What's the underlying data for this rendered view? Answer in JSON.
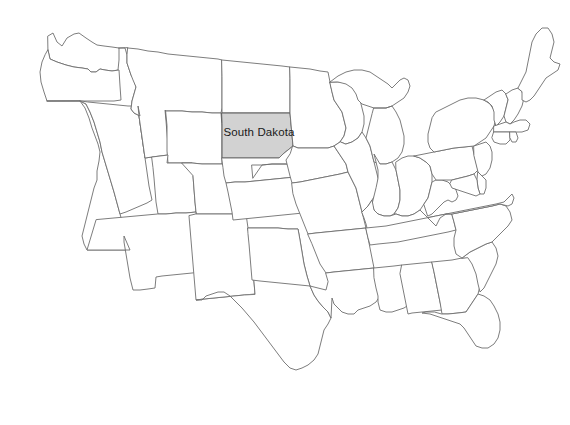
{
  "map": {
    "title": "United States contiguous states outline map",
    "background_color": "#ffffff",
    "default_state_fill": "#ffffff",
    "state_border_color": "#6e6e6e",
    "highlight_fill": "#d2d2d2",
    "highlight_border_color": "#5a5a5a",
    "label_color": "#1a1a1a",
    "highlighted_state": "South Dakota",
    "labels": [
      {
        "name": "south-dakota",
        "text": "South Dakota",
        "x": 259,
        "y": 133
      }
    ],
    "states": [
      {
        "id": "washington",
        "name": "Washington",
        "highlighted": false,
        "path": "M48,36 L53,33 L57,42 L62,46 L67,38 L74,34 L79,33 L86,38 L92,42 L97,45 L104,46 L112,47 L119,48 L119,60 L118,70 L112,71 L105,70 L100,69 L96,72 L91,72 L88,69 L82,68 L74,67 L66,65 L57,62 L50,59 L48,50 Z"
      },
      {
        "id": "oregon",
        "name": "Oregon",
        "highlighted": false,
        "path": "M48,50 L50,59 L57,62 L66,65 L74,67 L82,68 L88,69 L91,72 L96,72 L100,69 L105,70 L112,71 L119,70 L120,86 L121,100 L114,101 L104,101 L92,101 L80,101 L70,101 L61,101 L53,101 L47,101 L44,92 L41,82 L40,72 L42,62 L45,55 Z"
      },
      {
        "id": "california",
        "name": "California",
        "highlighted": false,
        "path": "M47,101 L53,101 L61,101 L70,101 L80,101 L85,108 L89,118 L92,128 L95,136 L98,144 L100,152 L99,161 L97,171 L97,180 L94,188 L92,196 L90,204 L88,212 L86,220 L84,228 L82,236 L84,244 L87,250 L92,250 L100,250 L108,250 L116,250 L124,250 L130,250 L128,242 L126,234 L123,225 L120,214 L117,203 L114,192 L111,182 L108,172 L105,162 L102,152 L100,142 L97,132 L94,122 L90,112 L86,104 L80,101 Z"
      },
      {
        "id": "nevada",
        "name": "Nevada",
        "highlighted": false,
        "path": "M80,101 L86,104 L90,112 L94,122 L97,132 L100,142 L102,152 L105,162 L108,172 L111,182 L114,192 L117,203 L120,214 L126,212 L133,209 L140,206 L147,203 L152,200 L149,186 L147,172 L145,158 L143,144 L141,130 L139,116 L138,106 L128,106 L118,105 L108,104 L98,103 L88,102 Z"
      },
      {
        "id": "idaho",
        "name": "Idaho",
        "highlighted": false,
        "path": "M119,48 L125,48 L127,55 L127,63 L129,69 L131,75 L134,80 L136,87 L134,94 L132,101 L131,109 L134,113 L140,116 L138,106 L139,116 L141,130 L143,144 L145,158 L152,157 L160,156 L168,155 L168,145 L167,133 L166,121 L165,110 L160,110 L155,110 L150,106 L145,101 L140,96 L137,88 L135,80 L133,72 L131,64 L130,56 L128,48 Z"
      },
      {
        "id": "montana",
        "name": "Montana",
        "highlighted": false,
        "path": "M128,48 L138,49 L148,51 L158,52 L168,54 L178,55 L188,56 L198,57 L208,58 L218,59 L222,60 L222,72 L222,84 L222,96 L222,108 L221,113 L212,113 L202,112 L192,112 L182,111 L172,111 L166,111 L165,110 L166,121 L167,133 L168,145 L168,155 L160,156 L152,157 L145,158 L143,144 L141,130 L139,116 L138,106 L140,116 L134,113 L131,109 L132,101 L134,94 L136,87 L133,80 L131,75 L129,69 L127,63 L127,55 Z"
      },
      {
        "id": "wyoming",
        "name": "Wyoming",
        "highlighted": false,
        "path": "M166,111 L172,111 L182,111 L192,112 L202,112 L212,113 L221,113 L222,126 L222,139 L222,152 L222,164 L212,164 L202,164 L192,163 L182,163 L173,163 L168,163 L167,151 L167,139 L167,126 Z"
      },
      {
        "id": "utah",
        "name": "Utah",
        "highlighted": false,
        "path": "M152,157 L160,156 L168,155 L167,163 L168,163 L173,163 L182,163 L192,163 L193,176 L194,189 L195,202 L196,212 L186,213 L176,213 L166,214 L158,214 L156,202 L155,190 L154,178 L153,168 Z"
      },
      {
        "id": "colorado",
        "name": "Colorado",
        "highlighted": false,
        "path": "M182,163 L192,163 L202,164 L212,164 L222,164 L232,164 L242,164 L252,165 L253,178 L254,191 L255,204 L256,214 L246,214 L236,214 L226,214 L216,214 L206,214 L196,214 L196,212 L195,202 L194,189 L193,176 Z"
      },
      {
        "id": "arizona",
        "name": "Arizona",
        "highlighted": false,
        "path": "M158,214 L166,214 L176,213 L186,213 L196,212 L196,214 L197,226 L198,238 L199,250 L200,262 L201,272 L192,273 L182,274 L172,275 L162,276 L156,277 L155,288 L148,289 L140,290 L133,290 L130,278 L128,266 L126,254 L124,242 L124,236 L130,250 L124,250 L116,250 L108,250 L100,250 L92,250 L87,250 L90,240 L93,230 L96,220 Z"
      },
      {
        "id": "new-mexico",
        "name": "New Mexico",
        "highlighted": false,
        "path": "M196,214 L206,214 L216,214 L226,214 L236,214 L246,214 L248,228 L250,242 L251,256 L253,270 L254,282 L255,294 L244,295 L234,296 L224,297 L214,298 L204,299 L196,300 L195,288 L194,276 L193,264 L192,252 L191,240 L190,228 L189,216 Z"
      },
      {
        "id": "texas",
        "name": "Texas",
        "highlighted": false,
        "path": "M255,294 L254,282 L253,270 L251,256 L250,242 L248,228 L258,228 L268,228 L278,228 L288,229 L298,229 L300,240 L302,252 L304,264 L307,276 L310,286 L314,295 L318,301 L323,307 L328,312 L331,318 L328,324 L324,330 L322,338 L320,346 L318,354 L314,360 L308,365 L302,368 L296,370 L290,368 L284,362 L278,354 L272,346 L266,338 L260,330 L254,322 L248,315 L242,308 L236,302 L230,296 L224,292 L218,292 L212,294 L206,296 L202,300 L196,300 L204,299 L214,298 L224,297 L234,296 L244,295 Z"
      },
      {
        "id": "north-dakota",
        "name": "North Dakota",
        "highlighted": false,
        "path": "M222,60 L232,61 L242,62 L252,63 L262,64 L272,65 L282,66 L290,67 L290,79 L290,91 L290,103 L290,113 L280,113 L270,113 L260,113 L250,113 L240,113 L230,113 L222,113 L222,101 L222,89 L222,77 Z"
      },
      {
        "id": "south-dakota",
        "name": "South Dakota",
        "highlighted": true,
        "path": "M222,113 L230,113 L240,113 L250,113 L260,113 L270,113 L280,113 L290,113 L291,124 L292,135 L293,146 L288,150 L283,154 L279,158 L272,158 L262,158 L252,158 L242,158 L232,158 L222,158 L222,147 L222,136 L222,124 Z"
      },
      {
        "id": "nebraska",
        "name": "Nebraska",
        "highlighted": false,
        "path": "M222,158 L232,158 L242,158 L252,158 L262,158 L272,158 L279,158 L283,154 L288,150 L293,146 L296,152 L300,158 L304,164 L308,170 L312,175 L305,176 L295,177 L285,178 L275,179 L265,180 L255,181 L245,182 L235,182 L226,183 L224,176 L223,168 Z"
      },
      {
        "id": "kansas",
        "name": "Kansas",
        "highlighted": false,
        "path": "M252,165 L262,165 L272,164 L282,164 L292,164 L300,164 L308,170 L312,175 L305,176 L295,177 L285,178 L275,179 L265,180 L255,181 L245,182 L235,182 L226,183 L228,192 L230,202 L232,212 L233,220 L243,219 L253,218 L263,217 L273,216 L283,215 L293,214 L303,213 L313,212 L318,212 L316,202 L314,192 L312,182 L310,175 L305,176 L312,175 L308,170 L300,164 L292,164 L282,164 L272,164 L262,165 L253,178 Z"
      },
      {
        "id": "oklahoma",
        "name": "Oklahoma",
        "highlighted": false,
        "path": "M248,228 L258,228 L268,228 L278,228 L288,229 L298,229 L300,240 L302,252 L304,264 L307,276 L310,286 L300,285 L290,284 L280,283 L270,282 L260,281 L252,280 L251,268 L250,256 L249,244 L248,234 Z"
      },
      {
        "id": "minnesota",
        "name": "Minnesota",
        "highlighted": false,
        "path": "M290,67 L300,68 L310,69 L320,71 L328,72 L330,82 L332,92 L334,100 L338,106 L342,112 L344,120 L346,128 L344,136 L340,142 L334,146 L328,148 L322,148 L316,148 L310,148 L304,148 L298,148 L293,146 L292,135 L291,124 L290,113 L290,103 L290,91 L290,79 Z"
      },
      {
        "id": "iowa",
        "name": "Iowa",
        "highlighted": false,
        "path": "M293,146 L298,148 L304,148 L310,148 L316,148 L322,148 L328,148 L334,146 L338,152 L342,158 L346,164 L348,172 L340,174 L330,176 L320,178 L310,180 L300,182 L292,183 L290,176 L288,168 L286,160 L290,154 Z"
      },
      {
        "id": "missouri",
        "name": "Missouri",
        "highlighted": false,
        "path": "M292,183 L300,182 L310,180 L320,178 L330,176 L340,174 L348,172 L352,180 L356,188 L358,196 L360,204 L362,212 L364,220 L366,228 L356,229 L346,230 L336,231 L326,232 L316,233 L308,234 L304,224 L300,214 L296,204 L293,194 Z"
      },
      {
        "id": "arkansas",
        "name": "Arkansas",
        "highlighted": false,
        "path": "M308,234 L316,233 L326,232 L336,231 L346,230 L356,229 L366,228 L368,238 L370,248 L372,258 L374,268 L364,269 L354,270 L344,271 L334,272 L326,273 L320,264 L316,254 L312,244 Z"
      },
      {
        "id": "louisiana",
        "name": "Louisiana",
        "highlighted": false,
        "path": "M326,273 L334,272 L344,271 L354,270 L364,269 L374,268 L376,278 L378,288 L380,296 L376,302 L370,306 L364,308 L358,310 L354,314 L348,314 L342,312 L338,308 L334,304 L332,298 L331,318 L328,312 L323,307 L318,301 L314,295 L310,286 L318,288 L326,290 L328,282 Z"
      },
      {
        "id": "wisconsin",
        "name": "Wisconsin",
        "highlighted": false,
        "path": "M330,82 L338,82 L346,82 L352,84 L356,88 L358,94 L360,100 L362,108 L364,116 L364,124 L362,132 L358,138 L352,142 L346,144 L340,142 L344,136 L346,128 L344,120 L342,112 L338,106 L334,100 L332,92 Z"
      },
      {
        "id": "illinois",
        "name": "Illinois",
        "highlighted": false,
        "path": "M346,144 L352,142 L358,138 L362,132 L366,138 L370,146 L372,154 L374,162 L376,170 L378,178 L378,186 L376,194 L372,200 L368,206 L364,210 L362,212 L360,204 L358,196 L356,188 L352,180 L348,172 L346,164 L342,158 L338,152 L334,146 L340,142 Z"
      },
      {
        "id": "michigan",
        "name": "Michigan",
        "highlighted": false,
        "path": "M330,82 L338,76 L346,72 L354,70 L362,70 L370,72 L376,76 L382,80 L388,84 L392,88 L396,84 L400,80 L404,78 L408,80 L410,86 L408,92 L404,98 L398,102 L392,106 L386,108 L380,108 L374,108 L368,106 L362,104 L358,100 L356,94 L352,88 L346,84 L338,82 Z M374,108 L380,108 L386,108 L392,106 L396,112 L400,120 L402,128 L404,136 L404,144 L402,152 L398,158 L392,162 L386,164 L380,164 L374,162 L372,154 L370,146 L366,138 L368,130 L370,122 L372,114 Z"
      },
      {
        "id": "indiana",
        "name": "Indiana",
        "highlighted": false,
        "path": "M378,178 L378,170 L376,162 L374,154 L380,164 L386,164 L392,162 L396,170 L398,180 L400,190 L400,200 L398,208 L394,214 L390,216 L384,216 L378,214 L374,210 L372,204 L374,196 L376,188 Z"
      },
      {
        "id": "ohio",
        "name": "Ohio",
        "highlighted": false,
        "path": "M396,162 L402,158 L408,156 L414,156 L420,158 L426,162 L430,166 L432,174 L432,182 L430,190 L428,198 L424,204 L420,210 L414,214 L408,216 L402,216 L396,214 L394,214 L398,208 L400,200 L400,190 L398,180 L396,170 Z"
      },
      {
        "id": "kentucky",
        "name": "Kentucky",
        "highlighted": false,
        "path": "M362,212 L368,206 L372,200 L374,210 L378,214 L384,216 L390,216 L396,214 L402,216 L408,216 L414,214 L420,210 L424,214 L428,218 L432,222 L436,226 L428,228 L418,230 L408,232 L398,234 L388,236 L378,237 L370,238 L368,232 L366,224 L364,218 Z"
      },
      {
        "id": "tennessee",
        "name": "Tennessee",
        "highlighted": false,
        "path": "M366,228 L376,227 L386,226 L396,224 L406,222 L416,220 L426,218 L436,216 L446,214 L452,214 L454,222 L456,230 L448,232 L438,234 L428,236 L418,238 L408,240 L398,242 L388,243 L378,244 L370,245 L368,238 Z"
      },
      {
        "id": "mississippi",
        "name": "Mississippi",
        "highlighted": false,
        "path": "M374,268 L384,267 L394,266 L402,265 L404,276 L406,286 L408,296 L410,304 L404,308 L398,310 L392,312 L386,312 L380,310 L378,302 L378,296 L376,288 L374,278 Z"
      },
      {
        "id": "alabama",
        "name": "Alabama",
        "highlighted": false,
        "path": "M402,265 L412,264 L422,263 L432,262 L434,272 L436,282 L438,292 L440,302 L442,310 L432,311 L422,312 L412,313 L408,314 L406,304 L404,294 L402,284 L400,274 Z"
      },
      {
        "id": "georgia",
        "name": "Georgia",
        "highlighted": false,
        "path": "M432,262 L442,261 L452,260 L462,258 L470,257 L474,266 L478,276 L480,286 L478,294 L474,300 L470,306 L466,312 L458,313 L448,314 L442,314 L440,302 L438,292 L436,282 L434,272 Z"
      },
      {
        "id": "florida",
        "name": "Florida",
        "highlighted": false,
        "path": "M442,314 L448,314 L458,313 L466,312 L470,306 L474,300 L478,294 L484,296 L490,300 L494,306 L498,314 L500,322 L500,330 L498,338 L494,344 L488,348 L482,348 L476,346 L472,340 L468,334 L464,328 L460,324 L454,322 L448,320 L442,318 L436,316 L430,314 L422,313 L426,312 L434,312 Z"
      },
      {
        "id": "south-carolina",
        "name": "South Carolina",
        "highlighted": false,
        "path": "M462,258 L470,252 L478,248 L486,244 L492,242 L496,248 L498,256 L496,264 L492,272 L488,280 L484,288 L480,292 L478,284 L476,274 L472,264 L468,258 Z"
      },
      {
        "id": "north-carolina",
        "name": "North Carolina",
        "highlighted": false,
        "path": "M452,214 L462,212 L472,210 L482,208 L492,206 L500,204 L506,206 L510,212 L512,220 L508,226 L502,232 L496,238 L492,242 L486,244 L478,248 L470,252 L462,258 L456,254 L454,246 L454,238 L456,230 L454,222 Z"
      },
      {
        "id": "virginia",
        "name": "Virginia",
        "highlighted": false,
        "path": "M436,216 L446,214 L456,212 L466,210 L476,208 L486,206 L496,204 L504,202 L508,198 L512,194 L514,198 L512,204 L508,206 L500,204 L492,206 L482,208 L472,210 L462,212 L452,214 L446,214 L440,218 L436,226 L432,222 L428,218 Z"
      },
      {
        "id": "west-virginia",
        "name": "West Virginia",
        "highlighted": false,
        "path": "M424,204 L428,198 L430,190 L432,182 L436,180 L442,180 L448,182 L452,186 L456,190 L458,196 L456,200 L452,202 L448,200 L444,202 L440,206 L436,210 L432,214 L428,216 Z"
      },
      {
        "id": "pennsylvania",
        "name": "Pennsylvania",
        "highlighted": false,
        "path": "M414,156 L424,154 L434,152 L444,150 L454,148 L464,147 L472,146 L474,154 L476,162 L478,170 L474,174 L468,176 L460,178 L452,180 L444,180 L436,180 L432,174 L430,166 L426,162 L420,158 Z"
      },
      {
        "id": "new-york",
        "name": "New York",
        "highlighted": false,
        "path": "M436,112 L444,108 L452,104 L460,100 L468,98 L476,98 L484,100 L490,104 L494,110 L496,118 L494,126 L490,132 L486,138 L480,142 L474,146 L464,147 L454,148 L444,150 L434,152 L430,148 L428,142 L428,134 L430,126 L432,118 Z"
      },
      {
        "id": "vermont",
        "name": "Vermont",
        "highlighted": false,
        "path": "M484,100 L490,96 L496,92 L502,90 L506,94 L508,100 L506,108 L504,116 L500,122 L496,126 L494,120 L494,112 L492,106 L488,102 Z"
      },
      {
        "id": "new-hampshire",
        "name": "New Hampshire",
        "highlighted": false,
        "path": "M506,94 L512,90 L518,88 L522,92 L524,98 L522,106 L518,114 L514,120 L510,124 L506,122 L504,116 L506,108 L508,100 Z"
      },
      {
        "id": "maine",
        "name": "Maine",
        "highlighted": false,
        "path": "M518,88 L522,80 L526,72 L528,62 L530,52 L532,42 L536,34 L542,28 L548,28 L552,34 L554,42 L552,50 L550,58 L554,62 L560,64 L558,70 L552,74 L546,78 L542,84 L538,90 L534,96 L530,100 L526,102 L522,100 L522,92 Z"
      },
      {
        "id": "massachusetts",
        "name": "Massachusetts",
        "highlighted": false,
        "path": "M494,126 L500,124 L506,122 L510,124 L514,122 L520,120 L526,120 L530,124 L528,130 L522,132 L516,132 L510,132 L504,132 L498,132 L494,132 Z"
      },
      {
        "id": "connecticut",
        "name": "Connecticut",
        "highlighted": false,
        "path": "M494,132 L500,132 L506,132 L510,132 L510,140 L506,144 L500,144 L494,142 L492,138 Z"
      },
      {
        "id": "rhode-island",
        "name": "Rhode Island",
        "highlighted": false,
        "path": "M510,132 L516,132 L518,138 L516,142 L512,142 L510,138 Z"
      },
      {
        "id": "new-jersey",
        "name": "New Jersey",
        "highlighted": false,
        "path": "M474,146 L480,144 L486,142 L490,146 L492,152 L492,160 L490,168 L486,174 L482,176 L478,172 L476,164 L474,156 Z"
      },
      {
        "id": "delaware",
        "name": "Delaware",
        "highlighted": false,
        "path": "M478,172 L482,176 L486,180 L486,188 L484,194 L480,194 L478,188 L477,180 Z"
      },
      {
        "id": "maryland",
        "name": "Maryland",
        "highlighted": false,
        "path": "M452,180 L460,178 L468,176 L474,174 L477,180 L478,188 L480,194 L476,196 L470,194 L464,192 L458,190 L452,188 L450,184 Z"
      }
    ]
  }
}
